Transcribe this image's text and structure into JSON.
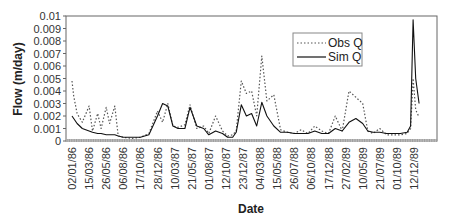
{
  "chart_data": {
    "type": "line",
    "title": "",
    "xlabel": "Date",
    "ylabel": "Flow (m/day)",
    "ylim": [
      0,
      0.01
    ],
    "grid": false,
    "legend_position": "upper-right-inside",
    "y_ticks": [
      0,
      0.001,
      0.002,
      0.003,
      0.004,
      0.005,
      0.006,
      0.007,
      0.008,
      0.009,
      0.01
    ],
    "y_tick_labels": [
      "0",
      "0.001",
      "0.002",
      "0.003",
      "0.004",
      "0.005",
      "0.006",
      "0.007",
      "0.008",
      "0.009",
      "0.01"
    ],
    "x_tick_labels": [
      "02/01/86",
      "15/03/86",
      "26/05/86",
      "06/08/86",
      "17/10/86",
      "28/12/86",
      "10/03/87",
      "21/05/87",
      "01/08/87",
      "12/10/87",
      "23/12/87",
      "04/03/88",
      "15/05/88",
      "26/07/88",
      "06/10/88",
      "17/12/88",
      "27/02/89",
      "10/05/89",
      "21/07/89",
      "01/10/89",
      "12/12/89"
    ],
    "x_tick_interval_days": 72,
    "values_are_approximate": true,
    "values_note": "Series values are a hand-traced approximation of the plotted shape, not the original daily data. The source plots ~1460 daily points per series; the x positions below are fractional tick indices (0 = 02/01/86, 1 unit = 72 days) at which the curve was sampled. Peak heights are read to roughly +/-0.0003 m/day; intermediate points are interpolated by eye.",
    "x_index": [
      0,
      0.1,
      0.3,
      0.6,
      1.0,
      1.2,
      1.5,
      1.7,
      2.0,
      2.2,
      2.5,
      2.7,
      3.0,
      3.5,
      4.0,
      4.5,
      5.0,
      5.3,
      5.6,
      5.9,
      6.2,
      6.6,
      6.9,
      7.3,
      7.7,
      8.0,
      8.4,
      8.8,
      9.1,
      9.4,
      9.6,
      9.9,
      10.2,
      10.5,
      10.8,
      11.1,
      11.4,
      11.8,
      12.2,
      12.6,
      13.0,
      13.4,
      13.8,
      14.2,
      14.6,
      15.0,
      15.4,
      15.8,
      16.2,
      16.6,
      17.0,
      17.3,
      17.6,
      18.0,
      18.4,
      18.8,
      19.2,
      19.6,
      19.8,
      19.95,
      20.1,
      20.3
    ],
    "series": [
      {
        "name": "Obs Q",
        "style": "dotted",
        "color": "#555555",
        "values": [
          0.0048,
          0.0036,
          0.0022,
          0.0015,
          0.0028,
          0.0008,
          0.0022,
          0.001,
          0.0027,
          0.0014,
          0.0028,
          0.0004,
          0.0003,
          0.0002,
          0.0003,
          0.0006,
          0.0024,
          0.0015,
          0.003,
          0.0012,
          0.0011,
          0.0013,
          0.0029,
          0.001,
          0.0012,
          0.0006,
          0.002,
          0.0008,
          0.0004,
          0.0005,
          0.0008,
          0.0048,
          0.0038,
          0.004,
          0.002,
          0.0068,
          0.0032,
          0.0037,
          0.0009,
          0.0007,
          0.0006,
          0.0009,
          0.0006,
          0.0012,
          0.0008,
          0.0006,
          0.002,
          0.0008,
          0.004,
          0.0035,
          0.003,
          0.0008,
          0.0006,
          0.001,
          0.0005,
          0.0005,
          0.0005,
          0.0006,
          0.001,
          0.005,
          0.0025,
          0.0019
        ]
      },
      {
        "name": "Sim Q",
        "style": "solid",
        "color": "#111111",
        "values": [
          0.002,
          0.0018,
          0.0014,
          0.001,
          0.0008,
          0.0007,
          0.0006,
          0.0006,
          0.0005,
          0.0005,
          0.0005,
          0.0004,
          0.0003,
          0.0003,
          0.0003,
          0.0005,
          0.002,
          0.003,
          0.0028,
          0.0012,
          0.001,
          0.001,
          0.0027,
          0.0012,
          0.001,
          0.0005,
          0.0008,
          0.0006,
          0.0003,
          0.0003,
          0.0007,
          0.0029,
          0.002,
          0.0022,
          0.0012,
          0.0031,
          0.002,
          0.0012,
          0.0007,
          0.0007,
          0.0006,
          0.0006,
          0.0006,
          0.0008,
          0.0006,
          0.0006,
          0.001,
          0.0008,
          0.0015,
          0.0018,
          0.0014,
          0.0008,
          0.0007,
          0.0007,
          0.0006,
          0.0006,
          0.0006,
          0.0007,
          0.0012,
          0.0097,
          0.005,
          0.003
        ]
      }
    ]
  },
  "legend": {
    "items": [
      {
        "label": "Obs Q",
        "style": "dotted"
      },
      {
        "label": "Sim Q",
        "style": "solid"
      }
    ]
  }
}
